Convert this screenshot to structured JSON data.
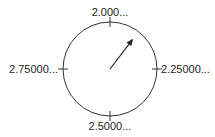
{
  "chart_data": {
    "type": "gauge",
    "title": "",
    "dial_labels": [
      {
        "position": "top",
        "text": "2.000...",
        "value": 2.0
      },
      {
        "position": "right",
        "text": "2.25000...",
        "value": 2.25
      },
      {
        "position": "bottom",
        "text": "2.5000...",
        "value": 2.5
      },
      {
        "position": "left",
        "text": "2.75000...",
        "value": 2.75
      }
    ],
    "range": [
      2.0,
      3.0
    ],
    "needle_value": 2.104,
    "colors": {
      "dial": "#333333",
      "needle": "#222222",
      "text": "#222222"
    }
  }
}
